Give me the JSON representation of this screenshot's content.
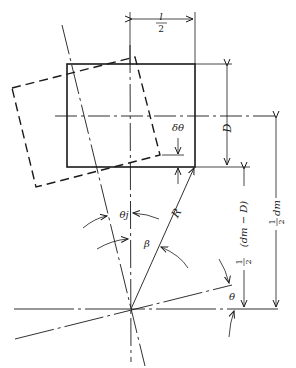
{
  "diagram": {
    "type": "engineering geometry diagram",
    "colors": {
      "line": "#1a1a1a",
      "background": "#ffffff"
    },
    "labels": {
      "half_length_num": "l",
      "half_length_den": "2",
      "depth": "D",
      "delta_theta": "δθ",
      "radius": "R",
      "theta_j": "θj",
      "beta": "β",
      "theta": "θ",
      "half_dm_minus_D": "½(dm − D)",
      "half_dm_minus_D_parts": {
        "frac_num": "1",
        "frac_den": "2",
        "expr": "(dm − D)"
      },
      "half_dm": "½ dm",
      "half_dm_parts": {
        "frac_num": "1",
        "frac_den": "2",
        "expr": "dm"
      }
    },
    "elements": {
      "solid_rectangle": "original section position",
      "dashed_rectangle": "rotated section position",
      "centerlines": [
        "horizontal centerline through section",
        "vertical centerline",
        "rotated centerline at angle θj",
        "base line at angle θ"
      ]
    }
  }
}
